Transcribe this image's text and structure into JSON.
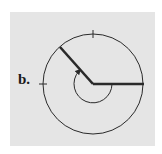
{
  "figure": {
    "label": "b.",
    "colors": {
      "panel_background": "#e5e5e5",
      "stroke": "#2a2a2a",
      "page_background": "#ffffff"
    },
    "circle": {
      "cx": 93,
      "cy": 84,
      "r": 50
    },
    "ticks": [
      "top",
      "left"
    ],
    "initial_ray": {
      "direction": "positive-x",
      "angle_deg": 0
    },
    "terminal_ray": {
      "direction": "upper-left",
      "angle_deg": 135
    },
    "angle_arc": {
      "r": 19,
      "sweep": "reflex, drawn through bottom, arrow at terminal ray"
    }
  }
}
